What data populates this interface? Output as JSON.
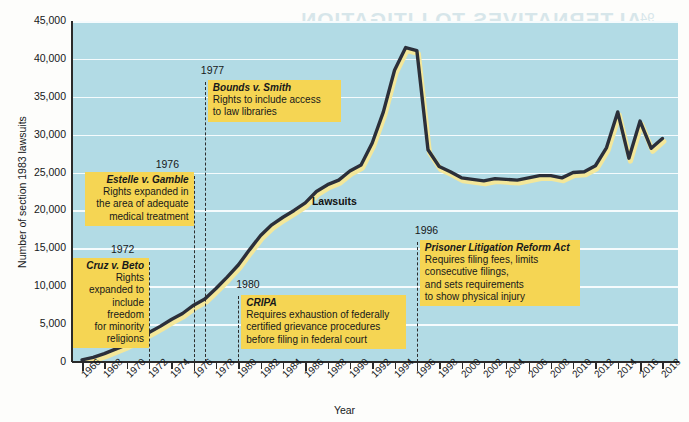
{
  "chart_data": {
    "type": "line",
    "title": "",
    "xlabel": "Year",
    "ylabel": "Number of section 1983 lawsuits",
    "xlim": [
      1965,
      2019
    ],
    "ylim": [
      0,
      45000
    ],
    "grid": true,
    "legend": "none",
    "series_label": "Lawsuits",
    "x_ticks": [
      "1966",
      "1968",
      "1970",
      "1972",
      "1974",
      "1976",
      "1978",
      "1980",
      "1982",
      "1984",
      "1986",
      "1988",
      "1990",
      "1992",
      "1994",
      "1996",
      "1998",
      "2000",
      "2002",
      "2004",
      "2006",
      "2008",
      "2010",
      "2012",
      "2014",
      "2016",
      "2018"
    ],
    "y_ticks": [
      "0",
      "5,000",
      "10,000",
      "15,000",
      "20,000",
      "25,000",
      "30,000",
      "35,000",
      "40,000",
      "45,000"
    ],
    "x": [
      1966,
      1967,
      1968,
      1969,
      1970,
      1971,
      1972,
      1973,
      1974,
      1975,
      1976,
      1977,
      1978,
      1979,
      1980,
      1981,
      1982,
      1983,
      1984,
      1985,
      1986,
      1987,
      1988,
      1989,
      1990,
      1991,
      1992,
      1993,
      1994,
      1995,
      1996,
      1997,
      1998,
      1999,
      2000,
      2001,
      2002,
      2003,
      2004,
      2005,
      2006,
      2007,
      2008,
      2009,
      2010,
      2011,
      2012,
      2013,
      2014,
      2015,
      2016,
      2017,
      2018
    ],
    "values": [
      280,
      600,
      1100,
      1700,
      2300,
      3000,
      3900,
      4700,
      5600,
      6400,
      7500,
      8300,
      9700,
      11200,
      12800,
      14800,
      16700,
      18100,
      19100,
      20000,
      21000,
      22500,
      23400,
      24000,
      25200,
      26000,
      28900,
      33000,
      38500,
      41500,
      41100,
      28000,
      25800,
      25100,
      24300,
      24100,
      23900,
      24200,
      24100,
      24000,
      24300,
      24600,
      24600,
      24300,
      25000,
      25100,
      25900,
      28300,
      33000,
      26900,
      31800,
      28200,
      29500
    ]
  },
  "annotations": [
    {
      "id": "cruz-v-beto",
      "year": "1972",
      "case": "Cruz v. Beto",
      "lines": [
        "Rights",
        "expanded to",
        "include",
        "freedom",
        "for minority",
        "religions"
      ],
      "align": "right"
    },
    {
      "id": "estelle-v-gamble",
      "year": "1976",
      "case": "Estelle v. Gamble",
      "lines": [
        "Rights expanded in",
        "the area of adequate",
        "medical treatment"
      ],
      "align": "right"
    },
    {
      "id": "bounds-v-smith",
      "year": "1977",
      "case": "Bounds v. Smith",
      "lines": [
        "Rights to include access",
        "to law libraries"
      ],
      "align": "left"
    },
    {
      "id": "cripa",
      "year": "1980",
      "case": "CRIPA",
      "lines": [
        "Requires exhaustion of federally",
        "certified grievance procedures",
        "before filing in federal court"
      ],
      "align": "left"
    },
    {
      "id": "prisoner-litigation-reform-act",
      "year": "1996",
      "case": "Prisoner Litigation Reform Act",
      "lines": [
        "Requires filing fees, limits",
        "consecutive filings,",
        "and sets requirements",
        "to show physical injury"
      ],
      "align": "left"
    }
  ],
  "page_bleed": {
    "title": "ALTERNATIVES TO LITIGATION",
    "page_number": "94",
    "lines": [
      "tives have been formalized and others",
      "a have been required for inmates to",
      "may be more capable of resolving",
      "these issues than courts are, and",
      "administrative remedies that are",
      "available to inmates before they",
      "can proceed to federal court",
      "mechanisms within correctional",
      "systems for resolving complaints"
    ]
  },
  "colors": {
    "plot_background": "#b2dbe5",
    "gridline": "#fbfeff",
    "series_line": "#2b2f3a",
    "series_shadow": "#f3e79a",
    "annotation_box": "#f5d553",
    "axis": "#2a2a2a",
    "text": "#16181a"
  }
}
